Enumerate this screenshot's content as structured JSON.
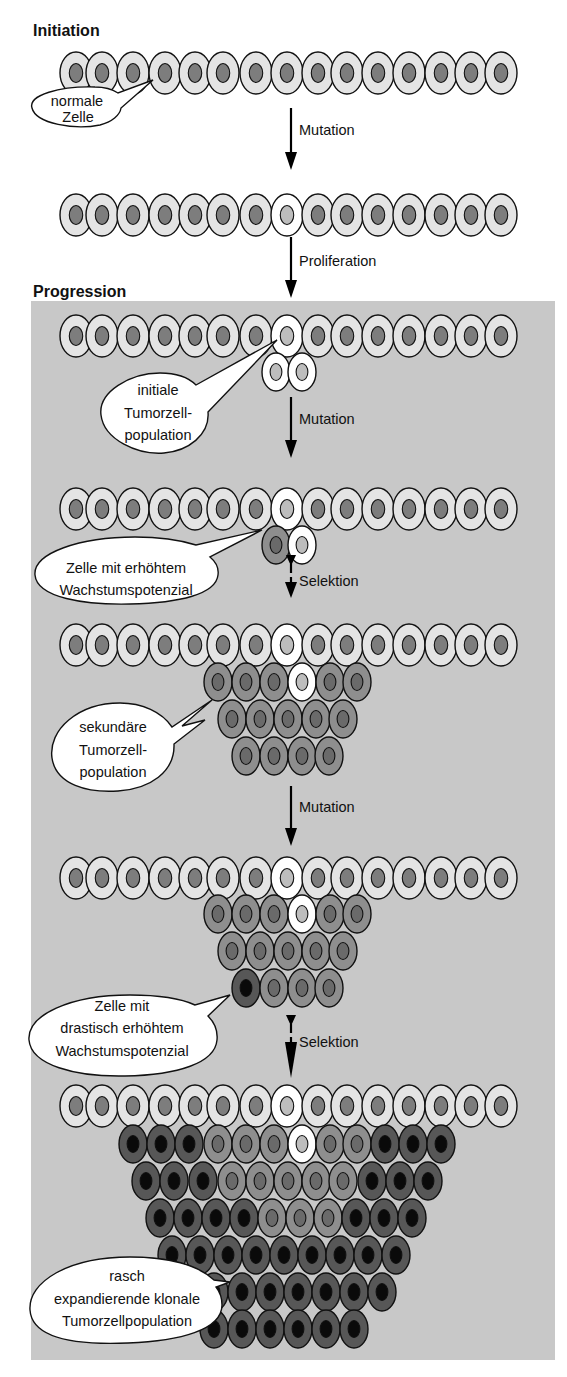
{
  "diagram": {
    "type": "process-flow",
    "sections": {
      "initiation": {
        "title": "Initiation"
      },
      "progression": {
        "title": "Progression"
      }
    },
    "steps": [
      {
        "id": "mutation_1",
        "label": "Mutation",
        "style": "solid"
      },
      {
        "id": "proliferation",
        "label": "Proliferation",
        "style": "solid"
      },
      {
        "id": "mutation_2",
        "label": "Mutation",
        "style": "solid"
      },
      {
        "id": "selektion_1",
        "label": "Selektion",
        "style": "dashed"
      },
      {
        "id": "mutation_3",
        "label": "Mutation",
        "style": "solid"
      },
      {
        "id": "selektion_2",
        "label": "Selektion",
        "style": "dashed"
      }
    ],
    "callouts": [
      {
        "id": "normale_zelle",
        "lines": [
          "normale",
          "Zelle"
        ]
      },
      {
        "id": "initiale_population",
        "lines": [
          "initiale",
          "Tumorzell-",
          "population"
        ]
      },
      {
        "id": "erhoehtes_wachstum",
        "lines": [
          "Zelle mit erhöhtem",
          "Wachstumspotenzial"
        ]
      },
      {
        "id": "sekundaere_population",
        "lines": [
          "sekundäre",
          "Tumorzell-",
          "population"
        ]
      },
      {
        "id": "drastisch_erhoeht",
        "lines": [
          "Zelle mit",
          "drastisch erhöhtem",
          "Wachstumspotenzial"
        ]
      },
      {
        "id": "klonale_population",
        "lines": [
          "rasch",
          "expandierende klonale",
          "Tumorzellpopulation"
        ]
      }
    ],
    "cell_types": {
      "normal": {
        "fill": "#e4e4e4",
        "nucleus": "#7d7d7d"
      },
      "mutated": {
        "fill": "#ffffff",
        "nucleus": "#bdbdbd"
      },
      "secondary": {
        "fill": "#8e8e8e",
        "nucleus": "#6a6a6a"
      },
      "aggressive": {
        "fill": "#575757",
        "nucleus": "#0a0a0a"
      }
    },
    "colors": {
      "progression_background": "#c8c8c8",
      "page_background": "#ffffff",
      "stroke": "#111111"
    }
  },
  "labels": {
    "initiation_title": "Initiation",
    "progression_title": "Progression",
    "step_1": "Mutation",
    "step_2": "Proliferation",
    "step_3": "Mutation",
    "step_4": "Selektion",
    "step_5": "Mutation",
    "step_6": "Selektion",
    "callout_1_l1": "normale",
    "callout_1_l2": "Zelle",
    "callout_2_l1": "initiale",
    "callout_2_l2": "Tumorzell-",
    "callout_2_l3": "population",
    "callout_3_l1": "Zelle mit erhöhtem",
    "callout_3_l2": "Wachstumspotenzial",
    "callout_4_l1": "sekundäre",
    "callout_4_l2": "Tumorzell-",
    "callout_4_l3": "population",
    "callout_5_l1": "Zelle mit",
    "callout_5_l2": "drastisch erhöhtem",
    "callout_5_l3": "Wachstumspotenzial",
    "callout_6_l1": "rasch",
    "callout_6_l2": "expandierende klonale",
    "callout_6_l3": "Tumorzellpopulation"
  }
}
